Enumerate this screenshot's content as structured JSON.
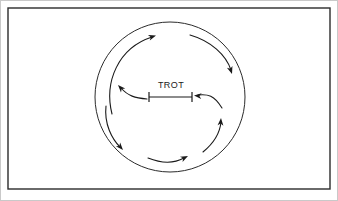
{
  "figure": {
    "background_color": "#ffffff",
    "ink_color": "#1a1a1a",
    "outer_border_color": "#c9c9c9",
    "frame": {
      "name": "diagram-frame",
      "x": 8,
      "y": 8,
      "width": 322,
      "height": 181,
      "stroke": "#2b2b2b",
      "stroke_width": 1.4
    },
    "circle": {
      "name": "outer-circle",
      "center_x": 170,
      "center_y": 97,
      "radius": 75,
      "stroke": "#2b2b2b",
      "stroke_width": 1
    },
    "center_marker": {
      "name": "trot-span-marker",
      "label": "TROT",
      "line_y": 97,
      "left_tick_x": 149,
      "right_tick_x": 192,
      "tick_half_height": 5,
      "stroke": "#1a1a1a",
      "stroke_width": 1.2
    },
    "arrows": [
      {
        "name": "arc-arrow-upper-left",
        "description": "outer arc sweeping counter-clockwise up the left side, arrowhead pointing up-right at top",
        "path": "M 112 114 C 104 82, 118 48, 152 37",
        "head_x": 156,
        "head_y": 35.5,
        "head_angle_deg": -18
      },
      {
        "name": "arc-arrow-upper-right",
        "description": "outer arc sweeping down the upper right side, arrowhead pointing down",
        "path": "M 190 35 C 211 41, 226 55, 231 70",
        "head_x": 232,
        "head_y": 74,
        "head_angle_deg": 72
      },
      {
        "name": "arc-arrow-right-inward",
        "description": "inner arc from lower right curving left into the TROT marker, arrowhead pointing left",
        "path": "M 222 108 C 214 95, 208 94, 198 95",
        "head_x": 194,
        "head_y": 95.5,
        "head_angle_deg": 185
      },
      {
        "name": "arc-arrow-left-outward",
        "description": "inner arc from the TROT marker curving up-left, arrowhead pointing up-left",
        "path": "M 147 99 C 135 98, 128 96, 121 88",
        "head_x": 118,
        "head_y": 85,
        "head_angle_deg": -133
      },
      {
        "name": "arc-arrow-lower-left",
        "description": "outer arc sweeping down the lower left side, arrowhead pointing down-right",
        "path": "M 106 106 C 104 124, 112 139, 120 147",
        "head_x": 123,
        "head_y": 150,
        "head_angle_deg": 48
      },
      {
        "name": "arc-arrow-bottom",
        "description": "inner arc along the bottom, arrowhead pointing right",
        "path": "M 148 158 C 163 164, 175 163, 184 158",
        "head_x": 188,
        "head_y": 156,
        "head_angle_deg": -26
      },
      {
        "name": "arc-arrow-lower-right-up",
        "description": "inner arc from lower right sweeping up, arrowhead pointing up",
        "path": "M 203 152 C 214 143, 220 132, 221 122",
        "head_x": 221,
        "head_y": 118,
        "head_angle_deg": -86
      }
    ]
  }
}
